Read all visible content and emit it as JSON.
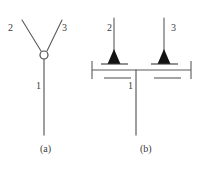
{
  "figure": {
    "width": 206,
    "height": 170,
    "background_color": "#ffffff",
    "line_color": "#5a5a5a",
    "fill_color": "#1a1a1a",
    "text_color": "#3a3a3a"
  },
  "panel_a": {
    "caption": "(a)",
    "description": "Y-junction with open circle node; branch labels 2 and 3 above, stem label 1 below",
    "labels": {
      "branch_left": "2",
      "branch_right": "3",
      "stem": "1"
    },
    "node": {
      "shape": "open-circle",
      "cx": 44,
      "cy": 55,
      "r": 4
    },
    "lines": [
      {
        "name": "branch-left",
        "x1": 22,
        "y1": 20,
        "x2": 41,
        "y2": 51
      },
      {
        "name": "branch-right",
        "x1": 62,
        "y1": 20,
        "x2": 47,
        "y2": 51
      },
      {
        "name": "stem",
        "x1": 44,
        "y1": 59,
        "x2": 44,
        "y2": 135
      }
    ]
  },
  "panel_b": {
    "caption": "(b)",
    "description": "Horizontal bar with terminal ticks, two downward filled triangles on short plates, vertical leads 2 and 3 above, stem 1 below",
    "labels": {
      "lead_left": "2",
      "lead_right": "3",
      "stem": "1"
    },
    "bar": {
      "x1": 92,
      "y1": 70,
      "x2": 191,
      "y2": 70
    },
    "terminals": [
      {
        "name": "terminal-left",
        "x": 92,
        "y1": 61,
        "y2": 79
      },
      {
        "name": "terminal-right",
        "x": 191,
        "y1": 61,
        "y2": 79
      }
    ],
    "leads": [
      {
        "name": "lead-left",
        "x": 114,
        "y1": 18,
        "y2": 62
      },
      {
        "name": "lead-right",
        "x": 164,
        "y1": 18,
        "y2": 62
      }
    ],
    "triangles": [
      {
        "name": "triangle-left",
        "apex_x": 114,
        "apex_y": 50,
        "base_y": 64,
        "half_width": 7
      },
      {
        "name": "triangle-right",
        "apex_x": 164,
        "apex_y": 50,
        "base_y": 64,
        "half_width": 7
      }
    ],
    "plates": [
      {
        "name": "plate-left",
        "x1": 101,
        "y1": 64,
        "x2": 128,
        "y2": 64
      },
      {
        "name": "plate-right",
        "x1": 151,
        "y1": 64,
        "x2": 178,
        "y2": 64
      },
      {
        "name": "plate-left-lower",
        "x1": 104,
        "y1": 78,
        "x2": 131,
        "y2": 78
      },
      {
        "name": "plate-right-lower",
        "x1": 154,
        "y1": 78,
        "x2": 181,
        "y2": 78
      }
    ],
    "stem": {
      "x": 136,
      "y1": 70,
      "y2": 135
    }
  }
}
